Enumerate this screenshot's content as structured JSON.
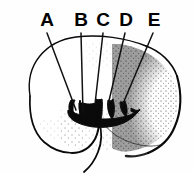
{
  "figure": {
    "style": "black ink line drawing with stipple shading",
    "background_color": "#fefefe",
    "ink_color": "#0a0a0a",
    "width": 194,
    "height": 174
  },
  "labels": [
    {
      "id": "A",
      "text": "A",
      "x": 47,
      "y": 26,
      "leader_start_x": 47,
      "leader_start_y": 33,
      "leader_end_x": 76,
      "leader_end_y": 110
    },
    {
      "id": "B",
      "text": "B",
      "x": 81,
      "y": 26,
      "leader_start_x": 81,
      "leader_start_y": 33,
      "leader_end_x": 82,
      "leader_end_y": 113
    },
    {
      "id": "C",
      "text": "C",
      "x": 103,
      "y": 26,
      "leader_start_x": 103,
      "leader_start_y": 33,
      "leader_end_x": 95,
      "leader_end_y": 105
    },
    {
      "id": "D",
      "text": "D",
      "x": 126,
      "y": 26,
      "leader_start_x": 125,
      "leader_start_y": 33,
      "leader_end_x": 108,
      "leader_end_y": 106
    },
    {
      "id": "E",
      "text": "E",
      "x": 154,
      "y": 26,
      "leader_start_x": 153,
      "leader_start_y": 33,
      "leader_end_x": 122,
      "leader_end_y": 107
    }
  ],
  "leader_count": 5,
  "structures": {
    "main_lobe_name": "rounded lobe outline",
    "protrusion_name": "villus-like protrusions",
    "protrusion_count": 5,
    "lower_curve_name": "lower boundary curve"
  }
}
